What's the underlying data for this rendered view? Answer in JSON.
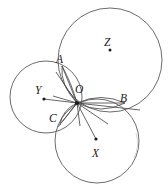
{
  "figure": {
    "kind": "geometry-diagram",
    "width": 168,
    "height": 184,
    "background_color": "#ffffff",
    "stroke_color": "#5a5a5a",
    "label_color": "#1a1a1a"
  },
  "labels": {
    "A": "A",
    "B": "B",
    "C": "C",
    "O": "O",
    "X": "X",
    "Y": "Y",
    "Z": "Z"
  },
  "chart_data": {
    "type": "scatter",
    "title": "",
    "xlabel": "",
    "ylabel": "",
    "grid": false,
    "legend": "none",
    "xlim": [
      0,
      168
    ],
    "ylim": [
      0,
      184
    ],
    "circles": [
      {
        "name": "Z",
        "cx": 110,
        "cy": 60,
        "r": 52
      },
      {
        "name": "Y",
        "cx": 46,
        "cy": 97,
        "r": 36
      },
      {
        "name": "X",
        "cx": 97,
        "cy": 141,
        "r": 42
      }
    ],
    "points": [
      {
        "name": "A",
        "x": 62,
        "y": 66,
        "kind": "intersection",
        "dot": false
      },
      {
        "name": "B",
        "x": 125,
        "y": 103,
        "kind": "intersection",
        "dot": false
      },
      {
        "name": "C",
        "x": 60,
        "y": 125,
        "kind": "intersection",
        "dot": false
      },
      {
        "name": "O",
        "x": 77,
        "y": 103,
        "kind": "radical-center",
        "dot": true
      },
      {
        "name": "X",
        "x": 97,
        "y": 141,
        "kind": "center",
        "dot": true
      },
      {
        "name": "Y",
        "x": 46,
        "y": 97,
        "kind": "center",
        "dot": true
      },
      {
        "name": "Z",
        "x": 110,
        "y": 60,
        "kind": "center",
        "dot": true
      }
    ],
    "segments": [
      {
        "from": "Y",
        "to": "O"
      },
      {
        "from": "O",
        "to": "X"
      },
      {
        "from": "O",
        "to": "A"
      },
      {
        "from": "O",
        "to": "B"
      },
      {
        "from": "O",
        "to": "C"
      }
    ]
  },
  "label_positions": {
    "A": {
      "left": 56,
      "top": 54
    },
    "B": {
      "left": 120,
      "top": 93
    },
    "C": {
      "left": 49,
      "top": 113
    },
    "O": {
      "left": 75,
      "top": 84
    },
    "X": {
      "left": 92,
      "top": 148
    },
    "Y": {
      "left": 35,
      "top": 85
    },
    "Z": {
      "left": 104,
      "top": 37
    }
  }
}
